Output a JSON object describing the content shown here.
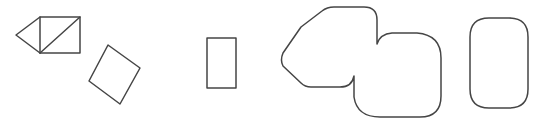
{
  "canvas": {
    "width": 545,
    "height": 128,
    "background_color": "#ffffff",
    "title": "geometric-shapes-row"
  },
  "style": {
    "stroke_color": "#454545",
    "stroke_color_dark": "#3a3a3a",
    "stroke_width": 1.5,
    "fill": "none"
  },
  "shapes": [
    {
      "id": "shape-1",
      "name": "square-with-diagonal-and-triangle",
      "description": "Axis-aligned square with a diagonal from bottom-left to top-right, joined on its left side by a triangle pointing left",
      "bbox": {
        "x": 15,
        "y": 16,
        "width": 66,
        "height": 38
      },
      "subparts": [
        {
          "name": "square-outline",
          "points": "40,17 80,17 80,53 40,53",
          "closed": true
        },
        {
          "name": "square-diagonal",
          "points": "40,53 80,17",
          "closed": false
        },
        {
          "name": "left-triangle",
          "points": "40,17 16,35 40,53",
          "closed": false
        }
      ]
    },
    {
      "id": "shape-2",
      "name": "rotated-rectangle",
      "description": "Rectangle rotated roughly 35 degrees clockwise",
      "bbox": {
        "x": 88,
        "y": 44,
        "width": 53,
        "height": 61
      },
      "subparts": [
        {
          "name": "rotated-rectangle-outline",
          "points": "108,45 140,68 120,104 89,81",
          "closed": true
        }
      ]
    },
    {
      "id": "shape-3",
      "name": "small-vertical-rectangle",
      "description": "Small upright rectangle, taller than wide",
      "bbox": {
        "x": 207,
        "y": 38,
        "width": 29,
        "height": 50
      },
      "subparts": [
        {
          "name": "vertical-rectangle-outline",
          "points": "207,38 236,38 236,88 207,88",
          "closed": true
        }
      ]
    },
    {
      "id": "shape-4",
      "name": "overlapping-rounded-polygons",
      "description": "Union outline of a rounded hexagon on the upper left and a rounded square on the lower right, meeting at two concave notches",
      "bbox": {
        "x": 281,
        "y": 6,
        "width": 160,
        "height": 112
      },
      "subparts": [
        {
          "name": "union-outline",
          "path": "M 301,27 L 322,11 Q 327,7 334,7 L 364,7 Q 377,7 377,20 L 377,44 Q 380,34 392,33 L 417,33 Q 441,35 441,58 L 441,96 Q 441,117 420,117 L 380,117 Q 357,117 354,97 L 354,76 Q 352,87 340,87 L 311,87 Q 305,87 301,83 L 283,66 Q 280,60 283,53 Z",
          "closed": true
        }
      ]
    },
    {
      "id": "shape-5",
      "name": "rounded-rectangle",
      "description": "Upright rectangle with large rounded corners",
      "bbox": {
        "x": 470,
        "y": 18,
        "width": 58,
        "height": 90
      },
      "subparts": [
        {
          "name": "rounded-rectangle-outline",
          "path": "M 489,18 L 509,18 Q 528,18 528,37 L 528,89 Q 528,108 509,108 L 489,108 Q 470,108 470,89 L 470,37 Q 470,18 489,18 Z",
          "closed": true,
          "corner_radius": 19
        }
      ]
    }
  ]
}
